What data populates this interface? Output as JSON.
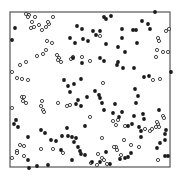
{
  "chart_data": {
    "type": "scatter",
    "title": "",
    "xlabel": "",
    "ylabel": "",
    "grid": false,
    "legend": null,
    "frame": {
      "left": 10,
      "top": 12,
      "right": 170,
      "bottom": 167,
      "color": "#555555"
    },
    "coordinate_system": "pixel coordinates of the 181x178 image (no axis ticks shown)",
    "series": [
      {
        "name": "open",
        "marker": "open-circle",
        "color": "#333333",
        "points": [
          [
            26,
            14
          ],
          [
            29,
            15
          ],
          [
            28,
            17
          ],
          [
            35,
            17
          ],
          [
            32,
            22
          ],
          [
            39,
            25
          ],
          [
            34,
            27
          ],
          [
            31,
            28
          ],
          [
            42,
            30
          ],
          [
            46,
            27
          ],
          [
            49,
            24
          ],
          [
            53,
            17
          ],
          [
            48,
            22
          ],
          [
            47,
            41
          ],
          [
            52,
            43
          ],
          [
            46,
            50
          ],
          [
            43,
            54
          ],
          [
            37,
            56
          ],
          [
            57,
            55
          ],
          [
            59,
            58
          ],
          [
            61,
            62
          ],
          [
            58,
            60
          ],
          [
            82,
            57
          ],
          [
            73,
            57
          ],
          [
            71,
            59
          ],
          [
            12,
            72
          ],
          [
            20,
            65
          ],
          [
            26,
            62
          ],
          [
            17,
            78
          ],
          [
            22,
            79
          ],
          [
            28,
            80
          ],
          [
            100,
            36
          ],
          [
            90,
            61
          ],
          [
            169,
            29
          ],
          [
            166,
            31
          ],
          [
            158,
            38
          ],
          [
            159,
            41
          ],
          [
            157,
            50
          ],
          [
            156,
            57
          ],
          [
            163,
            52
          ],
          [
            168,
            52
          ],
          [
            153,
            80
          ],
          [
            160,
            79
          ],
          [
            103,
            83
          ],
          [
            22,
            97
          ],
          [
            24,
            97
          ],
          [
            26,
            103
          ],
          [
            23,
            101
          ],
          [
            42,
            101
          ],
          [
            41,
            106
          ],
          [
            43,
            110
          ],
          [
            44,
            112
          ],
          [
            58,
            103
          ],
          [
            70,
            105
          ],
          [
            67,
            106
          ],
          [
            12,
            108
          ],
          [
            20,
            145
          ],
          [
            24,
            146
          ],
          [
            17,
            151
          ],
          [
            17,
            153
          ],
          [
            24,
            156
          ],
          [
            12,
            158
          ],
          [
            41,
            149
          ],
          [
            53,
            149
          ],
          [
            63,
            153
          ],
          [
            113,
            121
          ],
          [
            118,
            120
          ],
          [
            125,
            126
          ],
          [
            116,
            125
          ],
          [
            145,
            129
          ],
          [
            150,
            131
          ],
          [
            152,
            129
          ],
          [
            156,
            127
          ],
          [
            159,
            127
          ],
          [
            158,
            124
          ],
          [
            157,
            122
          ],
          [
            163,
            116
          ],
          [
            164,
            118
          ],
          [
            102,
            138
          ],
          [
            116,
            147
          ],
          [
            98,
            154
          ],
          [
            102,
            158
          ],
          [
            104,
            160
          ],
          [
            114,
            147
          ],
          [
            139,
            147
          ],
          [
            124,
            140
          ],
          [
            131,
            145
          ],
          [
            158,
            160
          ],
          [
            97,
            165
          ],
          [
            107,
            164
          ],
          [
            91,
            163
          ],
          [
            117,
            150
          ],
          [
            121,
            155
          ],
          [
            90,
            117
          ]
        ]
      },
      {
        "name": "filled",
        "marker": "filled-circle",
        "color": "#1a1a1a",
        "points": [
          [
            15,
            28
          ],
          [
            12,
            40
          ],
          [
            77,
            26
          ],
          [
            82,
            29
          ],
          [
            93,
            31
          ],
          [
            104,
            17
          ],
          [
            106,
            19
          ],
          [
            111,
            16
          ],
          [
            75,
            43
          ],
          [
            83,
            39
          ],
          [
            100,
            31
          ],
          [
            96,
            35
          ],
          [
            122,
            29
          ],
          [
            122,
            38
          ],
          [
            106,
            44
          ],
          [
            133,
            30
          ],
          [
            136,
            30
          ],
          [
            142,
            21
          ],
          [
            148,
            24
          ],
          [
            155,
            12
          ],
          [
            150,
            29
          ],
          [
            70,
            38
          ],
          [
            88,
            41
          ],
          [
            73,
            58
          ],
          [
            82,
            63
          ],
          [
            104,
            61
          ],
          [
            100,
            58
          ],
          [
            118,
            62
          ],
          [
            117,
            65
          ],
          [
            123,
            68
          ],
          [
            125,
            52
          ],
          [
            118,
            47
          ],
          [
            134,
            68
          ],
          [
            137,
            43
          ],
          [
            149,
            76
          ],
          [
            144,
            77
          ],
          [
            171,
            72
          ],
          [
            138,
            96
          ],
          [
            136,
            103
          ],
          [
            122,
            112
          ],
          [
            135,
            89
          ],
          [
            159,
            110
          ],
          [
            134,
            116
          ],
          [
            128,
            126
          ],
          [
            141,
            137
          ],
          [
            141,
            131
          ],
          [
            81,
            79
          ],
          [
            74,
            84
          ],
          [
            64,
            80
          ],
          [
            68,
            86
          ],
          [
            70,
            92
          ],
          [
            95,
            91
          ],
          [
            87,
            97
          ],
          [
            78,
            100
          ],
          [
            76,
            104
          ],
          [
            81,
            106
          ],
          [
            102,
            103
          ],
          [
            100,
            98
          ],
          [
            99,
            95
          ],
          [
            104,
            110
          ],
          [
            113,
            113
          ],
          [
            115,
            104
          ],
          [
            119,
            117
          ],
          [
            143,
            114
          ],
          [
            144,
            119
          ],
          [
            139,
            127
          ],
          [
            132,
            124
          ],
          [
            85,
            126
          ],
          [
            62,
            136
          ],
          [
            68,
            136
          ],
          [
            72,
            137
          ],
          [
            76,
            138
          ],
          [
            74,
            142
          ],
          [
            78,
            147
          ],
          [
            80,
            151
          ],
          [
            81,
            154
          ],
          [
            51,
            140
          ],
          [
            56,
            141
          ],
          [
            41,
            130
          ],
          [
            45,
            133
          ],
          [
            67,
            128
          ],
          [
            61,
            150
          ],
          [
            72,
            160
          ],
          [
            85,
            155
          ],
          [
            92,
            162
          ],
          [
            100,
            162
          ],
          [
            106,
            152
          ],
          [
            120,
            159
          ],
          [
            125,
            158
          ],
          [
            128,
            157
          ],
          [
            131,
            153
          ],
          [
            157,
            148
          ],
          [
            165,
            156
          ],
          [
            168,
            156
          ],
          [
            110,
            164
          ],
          [
            160,
            143
          ],
          [
            165,
            140
          ],
          [
            166,
            130
          ],
          [
            165,
            134
          ],
          [
            14,
            124
          ],
          [
            16,
            120
          ],
          [
            18,
            127
          ],
          [
            28,
            137
          ],
          [
            28,
            160
          ],
          [
            29,
            168
          ],
          [
            37,
            166
          ],
          [
            48,
            165
          ]
        ]
      }
    ]
  }
}
